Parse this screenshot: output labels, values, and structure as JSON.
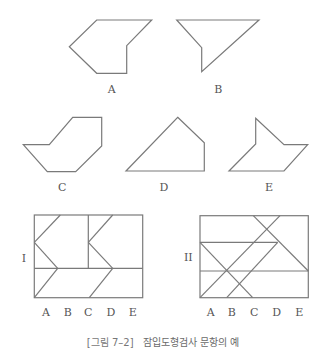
{
  "figure": {
    "caption_number": "[그림 7–2]",
    "caption_text": "잠입도형검사 문항의 예",
    "colors": {
      "stroke": "#7a7a7a",
      "label": "#555555",
      "caption": "#6a6a6a"
    }
  },
  "simple_figures": [
    {
      "label": "A",
      "points": "96.7,20 151.7,20 126.7,45.7 126.7,73.3 96.7,73.3 69.3,46.7",
      "label_x": 111.7,
      "label_y": 93
    },
    {
      "label": "B",
      "points": "176.7,20 259,20 201.7,71.7 201.7,47.7",
      "label_x": 218.3,
      "label_y": 93
    },
    {
      "label": "C",
      "points": "72.7,117.3 101.7,117.3 101.7,146 75.7,171.7 47.3,171.7 23.3,144.7 49.3,144.7",
      "label_x": 62.3,
      "label_y": 191
    },
    {
      "label": "D",
      "points": "177.7,117.3 204.3,142.7 204.3,171 126,171",
      "label_x": 164,
      "label_y": 191
    },
    {
      "label": "E",
      "points": "255.7,118.3 284,144.7 307.7,144.7 284,171 229,171 255.7,144",
      "label_x": 269,
      "label_y": 191
    }
  ],
  "complex_figures": [
    {
      "label": "I",
      "label_x": 24,
      "label_y": 262,
      "rect": {
        "x": 34.3,
        "y": 215,
        "w": 108.4,
        "h": 82.7
      },
      "lines": [
        [
          88.3,
          215,
          88.3,
          268.3
        ],
        [
          34.3,
          268.3,
          142.7,
          268.3
        ],
        [
          60.3,
          215,
          34.3,
          242.3
        ],
        [
          34.3,
          242.3,
          57.7,
          268.3
        ],
        [
          57.7,
          268.3,
          34.3,
          297.7
        ],
        [
          112.7,
          215,
          88.3,
          242.3
        ],
        [
          88.3,
          242.3,
          112.7,
          268.3
        ],
        [
          112.7,
          268.3,
          89.3,
          297.7
        ]
      ],
      "option_labels": [
        "A",
        "B",
        "C",
        "D",
        "E"
      ],
      "option_x": [
        46,
        67.7,
        88.3,
        111,
        132.7
      ],
      "option_y": 316
    },
    {
      "label": "II",
      "label_x": 188.3,
      "label_y": 261,
      "rect": {
        "x": 200,
        "y": 215.7,
        "w": 108.3,
        "h": 82
      },
      "lines": [
        [
          200,
          242.3,
          277.7,
          242.3
        ],
        [
          200,
          271,
          308.3,
          271
        ],
        [
          253.3,
          215.7,
          308.3,
          271
        ],
        [
          280,
          215.7,
          200,
          297.7
        ],
        [
          200,
          242.3,
          252.7,
          297.7
        ],
        [
          277.7,
          242.3,
          226.7,
          297.7
        ]
      ],
      "option_labels": [
        "A",
        "B",
        "C",
        "D",
        "E"
      ],
      "option_x": [
        210.7,
        231.7,
        254.3,
        276.7,
        299.3
      ],
      "option_y": 316
    }
  ]
}
